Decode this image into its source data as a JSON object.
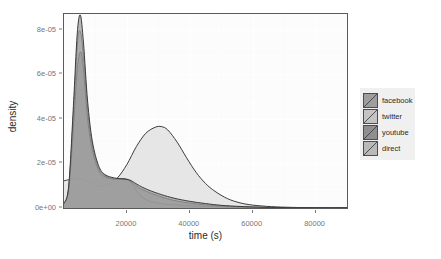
{
  "chart_data": {
    "type": "area",
    "title": "",
    "subtitle": "",
    "xlabel": "time (s)",
    "ylabel": "density",
    "xlim": [
      0,
      90000
    ],
    "ylim": [
      0,
      8.7e-05
    ],
    "grid": true,
    "legend_position": "right",
    "legend_title": "",
    "xticks": [
      20000,
      40000,
      60000,
      80000
    ],
    "xtick_labels": [
      "20000",
      "40000",
      "60000",
      "80000"
    ],
    "yticks": [
      0,
      2e-05,
      4e-05,
      6e-05,
      8e-05
    ],
    "ytick_labels": [
      "0e+00",
      "2e-05",
      "4e-05",
      "6e-05",
      "8e-05"
    ],
    "series": [
      {
        "name": "facebook",
        "fill": "#9e9e9e",
        "line": "#3c3c3c",
        "peak_x": 5200,
        "peak_y": 8.65e-05,
        "x": [
          0,
          1500,
          3000,
          4200,
          5200,
          6200,
          7500,
          9000,
          11000,
          13000,
          16000,
          19000,
          21000,
          24000,
          27000,
          31000,
          35000,
          40000,
          45000,
          50000,
          56000,
          62000,
          70000,
          80000,
          90000
        ],
        "y": [
          2e-06,
          1e-05,
          4.6e-05,
          7.8e-05,
          8.65e-05,
          7.4e-05,
          4.8e-05,
          3e-05,
          1.9e-05,
          1.5e-05,
          1.35e-05,
          1.3e-05,
          1.25e-05,
          1e-05,
          8e-06,
          6e-06,
          4.4e-06,
          3e-06,
          2e-06,
          1.2e-06,
          7e-07,
          4e-07,
          2e-07,
          1e-07,
          0.0
        ]
      },
      {
        "name": "twitter",
        "fill": "#c4c4c4",
        "line": "#3c3c3c",
        "peak_x": 5100,
        "peak_y": 7.95e-05,
        "x": [
          0,
          1500,
          3000,
          4200,
          5100,
          6200,
          7500,
          9000,
          11000,
          13000,
          16000,
          19000,
          21000,
          24000,
          27000,
          31000,
          35000,
          40000,
          45000,
          50000,
          56000,
          62000,
          70000,
          80000,
          90000
        ],
        "y": [
          2e-06,
          9e-06,
          4.2e-05,
          7.2e-05,
          7.95e-05,
          6.8e-05,
          4.4e-05,
          2.8e-05,
          1.8e-05,
          1.45e-05,
          1.3e-05,
          1.3e-05,
          1.2e-05,
          6e-06,
          3.2e-06,
          2e-06,
          1.4e-06,
          1e-06,
          7e-07,
          5e-07,
          3e-07,
          2e-07,
          1e-07,
          5e-08,
          0.0
        ]
      },
      {
        "name": "youtube",
        "fill": "#8f8f8f",
        "line": "#3c3c3c",
        "peak_x": 5300,
        "peak_y": 7e-05,
        "x": [
          0,
          1500,
          3000,
          4200,
          5300,
          6200,
          7500,
          9000,
          11000,
          13000,
          16000,
          19000,
          21000,
          24000,
          27000,
          31000,
          35000,
          40000,
          45000,
          50000,
          56000,
          62000,
          70000,
          80000,
          90000
        ],
        "y": [
          2e-06,
          8e-06,
          3.6e-05,
          6.2e-05,
          7e-05,
          6.2e-05,
          4e-05,
          2.6e-05,
          1.7e-05,
          1.4e-05,
          1.3e-05,
          1.3e-05,
          1.2e-05,
          9e-06,
          7e-06,
          5e-06,
          3.4e-06,
          2.2e-06,
          1.4e-06,
          9e-07,
          5e-07,
          3e-07,
          1.5e-07,
          7e-08,
          0.0
        ]
      },
      {
        "name": "direct",
        "fill": "#dedede",
        "line": "#3c3c3c",
        "peak_x": 31000,
        "peak_y": 3.65e-05,
        "early_bump_x": 5000,
        "early_bump_y": 1.32e-05,
        "x": [
          0,
          2000,
          5000,
          8000,
          11000,
          14000,
          17000,
          20000,
          23000,
          26000,
          29000,
          31000,
          33000,
          36000,
          39000,
          42000,
          45000,
          48000,
          52000,
          56000,
          60000,
          66000,
          72000,
          80000,
          90000
        ],
        "y": [
          1.22e-05,
          1.28e-05,
          1.32e-05,
          1.15e-05,
          1e-05,
          1.05e-05,
          1.35e-05,
          1.95e-05,
          2.75e-05,
          3.35e-05,
          3.62e-05,
          3.65e-05,
          3.5e-05,
          2.95e-05,
          2.25e-05,
          1.6e-05,
          1.1e-05,
          7.5e-06,
          4.2e-06,
          2.3e-06,
          1.3e-06,
          6e-07,
          3e-07,
          1e-07,
          0.0
        ]
      }
    ]
  },
  "axes": {
    "x_title": "time (s)",
    "y_title": "density"
  },
  "legend": {
    "items": [
      {
        "label": "facebook"
      },
      {
        "label": "twitter"
      },
      {
        "label": "youtube"
      },
      {
        "label": "direct"
      }
    ]
  }
}
